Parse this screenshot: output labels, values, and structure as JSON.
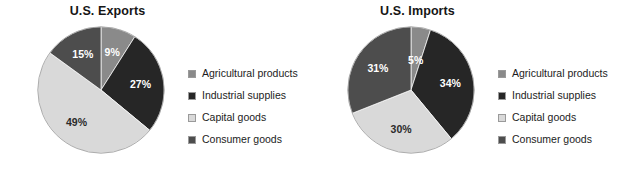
{
  "chart_data": [
    {
      "type": "pie",
      "title": "U.S. Exports",
      "categories": [
        "Agricultural products",
        "Industrial supplies",
        "Capital goods",
        "Consumer goods"
      ],
      "values": [
        9,
        27,
        49,
        15
      ],
      "value_labels": [
        "9%",
        "27%",
        "49%",
        "15%"
      ],
      "colors": [
        "#8a8a8a",
        "#262626",
        "#d9d9d9",
        "#4d4d4d"
      ],
      "legend_position": "right",
      "start_angle_deg": 0,
      "direction": "clockwise"
    },
    {
      "type": "pie",
      "title": "U.S. Imports",
      "categories": [
        "Agricultural products",
        "Industrial supplies",
        "Capital goods",
        "Consumer goods"
      ],
      "values": [
        5,
        34,
        30,
        31
      ],
      "value_labels": [
        "5%",
        "34%",
        "30%",
        "31%"
      ],
      "colors": [
        "#8a8a8a",
        "#262626",
        "#d9d9d9",
        "#4d4d4d"
      ],
      "legend_position": "right",
      "start_angle_deg": 0,
      "direction": "clockwise"
    }
  ],
  "exports": {
    "title": "U.S. Exports",
    "slices": [
      {
        "label": "Agricultural products",
        "value": 9,
        "value_label": "9%",
        "color": "#8a8a8a",
        "label_color": "light"
      },
      {
        "label": "Industrial supplies",
        "value": 27,
        "value_label": "27%",
        "color": "#262626",
        "label_color": "light"
      },
      {
        "label": "Capital goods",
        "value": 49,
        "value_label": "49%",
        "color": "#d9d9d9",
        "label_color": "dark"
      },
      {
        "label": "Consumer goods",
        "value": 15,
        "value_label": "15%",
        "color": "#4d4d4d",
        "label_color": "light"
      }
    ],
    "legend": [
      {
        "label": "Agricultural products",
        "color": "#8a8a8a"
      },
      {
        "label": "Industrial supplies",
        "color": "#262626"
      },
      {
        "label": "Capital goods",
        "color": "#d9d9d9"
      },
      {
        "label": "Consumer goods",
        "color": "#4d4d4d"
      }
    ]
  },
  "imports": {
    "title": "U.S. Imports",
    "slices": [
      {
        "label": "Agricultural products",
        "value": 5,
        "value_label": "5%",
        "color": "#8a8a8a",
        "label_color": "light"
      },
      {
        "label": "Industrial supplies",
        "value": 34,
        "value_label": "34%",
        "color": "#262626",
        "label_color": "light"
      },
      {
        "label": "Capital goods",
        "value": 30,
        "value_label": "30%",
        "color": "#d9d9d9",
        "label_color": "dark"
      },
      {
        "label": "Consumer goods",
        "value": 31,
        "value_label": "31%",
        "color": "#4d4d4d",
        "label_color": "light"
      }
    ],
    "legend": [
      {
        "label": "Agricultural products",
        "color": "#8a8a8a"
      },
      {
        "label": "Industrial supplies",
        "color": "#262626"
      },
      {
        "label": "Capital goods",
        "color": "#d9d9d9"
      },
      {
        "label": "Consumer goods",
        "color": "#4d4d4d"
      }
    ]
  }
}
